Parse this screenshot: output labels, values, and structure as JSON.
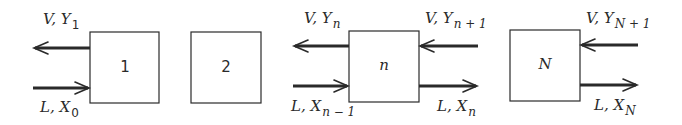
{
  "diagram": {
    "type": "countercurrent-stage-cascade",
    "stages": [
      {
        "label": "1",
        "italic": false
      },
      {
        "label": "2",
        "italic": false
      },
      {
        "label": "n",
        "italic": true
      },
      {
        "label": "N",
        "italic": true
      }
    ],
    "streams": {
      "v_y1": {
        "main": "V, Y",
        "sub": "1"
      },
      "l_x0": {
        "main": "L, X",
        "sub": "0"
      },
      "v_yn": {
        "main": "V, Y",
        "sub": "n"
      },
      "v_yn1": {
        "main": "V, Y",
        "sub": "n + 1"
      },
      "l_xn_1": {
        "main": "L, X",
        "sub": "n − 1"
      },
      "l_xn": {
        "main": "L, X",
        "sub": "n"
      },
      "v_yN1": {
        "main": "V, Y",
        "sub": "N + 1"
      },
      "l_xN": {
        "main": "L, X",
        "sub": "N"
      }
    },
    "colors": {
      "line": "#2a2a2a",
      "background": "#ffffff"
    }
  }
}
